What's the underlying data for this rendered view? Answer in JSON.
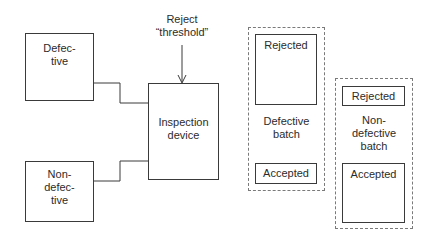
{
  "diagram": {
    "inputs": {
      "defective": {
        "label_line1": "Defec-",
        "label_line2": "tive"
      },
      "nondefective": {
        "label_line1": "Non-",
        "label_line2": "defec-",
        "label_line3": "tive"
      }
    },
    "device": {
      "label_line1": "Inspection",
      "label_line2": "device"
    },
    "threshold": {
      "label_line1": "Reject",
      "label_line2": "“threshold”"
    },
    "defective_batch": {
      "title_line1": "Defective",
      "title_line2": "batch",
      "rejected": "Rejected",
      "accepted": "Accepted"
    },
    "nondefective_batch": {
      "title_line1": "Non-",
      "title_line2": "defective",
      "title_line3": "batch",
      "rejected": "Rejected",
      "accepted": "Accepted"
    },
    "colors": {
      "line": "#3a3a3a",
      "dashed": "#7a7a7a",
      "background": "#ffffff"
    }
  }
}
